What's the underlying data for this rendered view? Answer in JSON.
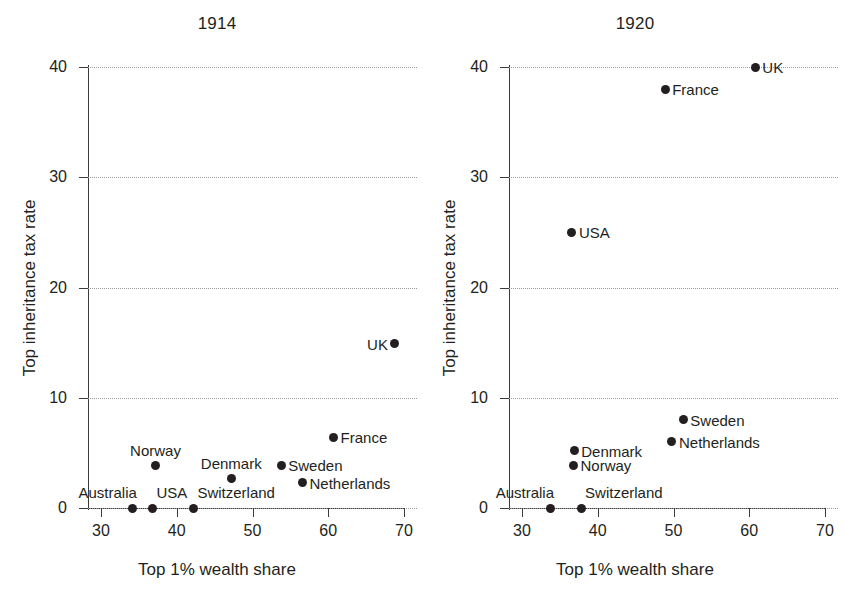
{
  "figure": {
    "background_color": "#ffffff",
    "point_color": "#231f20",
    "grid_color": "#9a9a9a",
    "axis_color": "#3b3b3b"
  },
  "axis_titles": {
    "x": "Top 1% wealth share",
    "y": "Top inheritance tax rate"
  },
  "panels": [
    {
      "key": "left",
      "title": "1914"
    },
    {
      "key": "right",
      "title": "1920"
    }
  ],
  "ticks": {
    "x": [
      "30",
      "40",
      "50",
      "60",
      "70"
    ],
    "y": [
      "0",
      "10",
      "20",
      "30",
      "40"
    ]
  },
  "chart_data": [
    {
      "type": "scatter",
      "title": "1914",
      "xlabel": "Top 1% wealth share",
      "ylabel": "Top inheritance tax rate",
      "xlim": [
        28,
        72
      ],
      "ylim": [
        -1.5,
        42
      ],
      "xticks": [
        30,
        40,
        50,
        60,
        70
      ],
      "yticks": [
        0,
        10,
        20,
        30,
        40
      ],
      "grid": "horizontal-dotted",
      "legend": "none (points labelled directly)",
      "points": [
        {
          "label": "Australia",
          "x": 34.2,
          "y": 0.0,
          "label_pos": "above-left"
        },
        {
          "label": "USA",
          "x": 36.8,
          "y": 0.0,
          "label_pos": "above-right"
        },
        {
          "label": "Switzerland",
          "x": 42.2,
          "y": 0.0,
          "label_pos": "above-right"
        },
        {
          "label": "Norway",
          "x": 37.2,
          "y": 3.9,
          "label_pos": "above"
        },
        {
          "label": "Denmark",
          "x": 47.2,
          "y": 2.7,
          "label_pos": "above"
        },
        {
          "label": "Sweden",
          "x": 53.8,
          "y": 3.9,
          "label_pos": "right"
        },
        {
          "label": "Netherlands",
          "x": 56.6,
          "y": 2.3,
          "label_pos": "right"
        },
        {
          "label": "France",
          "x": 60.7,
          "y": 6.4,
          "label_pos": "right"
        },
        {
          "label": "UK",
          "x": 68.8,
          "y": 14.9,
          "label_pos": "left"
        }
      ]
    },
    {
      "type": "scatter",
      "title": "1920",
      "xlabel": "Top 1% wealth share",
      "ylabel": "Top inheritance tax rate",
      "xlim": [
        28,
        72
      ],
      "ylim": [
        -1.5,
        42
      ],
      "xticks": [
        30,
        40,
        50,
        60,
        70
      ],
      "yticks": [
        0,
        10,
        20,
        30,
        40
      ],
      "grid": "horizontal-dotted",
      "legend": "none (points labelled directly)",
      "points": [
        {
          "label": "Australia",
          "x": 33.7,
          "y": 0.0,
          "label_pos": "above-left"
        },
        {
          "label": "Switzerland",
          "x": 37.8,
          "y": 0.0,
          "label_pos": "above-right"
        },
        {
          "label": "Norway",
          "x": 36.8,
          "y": 3.9,
          "label_pos": "right"
        },
        {
          "label": "Denmark",
          "x": 36.9,
          "y": 5.2,
          "label_pos": "right"
        },
        {
          "label": "Netherlands",
          "x": 49.8,
          "y": 6.0,
          "label_pos": "right"
        },
        {
          "label": "Sweden",
          "x": 51.3,
          "y": 8.0,
          "label_pos": "right"
        },
        {
          "label": "USA",
          "x": 36.6,
          "y": 25.0,
          "label_pos": "right"
        },
        {
          "label": "France",
          "x": 48.9,
          "y": 38.0,
          "label_pos": "right"
        },
        {
          "label": "UK",
          "x": 60.8,
          "y": 40.0,
          "label_pos": "right"
        }
      ]
    }
  ]
}
